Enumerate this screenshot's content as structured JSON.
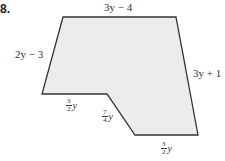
{
  "problem_number": "8.",
  "shape": {
    "fill": "#ececec",
    "stroke": "#333333",
    "vertices": [
      [
        63,
        17
      ],
      [
        176,
        17
      ],
      [
        198,
        135
      ],
      [
        135,
        135
      ],
      [
        107,
        94
      ],
      [
        42,
        94
      ]
    ]
  },
  "labels": {
    "top": "3y − 4",
    "left": "2y − 3",
    "right": "3y + 1",
    "bottom_left": {
      "num": "3",
      "den": "2",
      "var": "y"
    },
    "slant": {
      "num": "7",
      "den": "4",
      "var": "y"
    },
    "bottom_right": {
      "num": "3",
      "den": "2",
      "var": "y"
    }
  }
}
